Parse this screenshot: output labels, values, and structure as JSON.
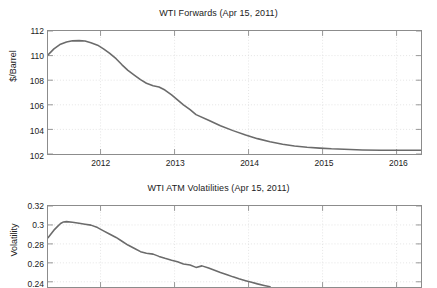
{
  "figure": {
    "width": 437,
    "height": 288,
    "background": "#ffffff",
    "line_color": "#6b6b6b",
    "axis_color": "#8c8c8c",
    "grid_color": "#d9d9d9",
    "note": "MATLAB-style two-panel figure; lower panel is cropped at the image bottom edge"
  },
  "chart_data": [
    {
      "type": "line",
      "panel": "upper",
      "title": "WTI Forwards (Apr 15, 2011)",
      "xlabel": "",
      "ylabel": "$/Barrel",
      "xlim": [
        2011.29,
        2016.33
      ],
      "ylim": [
        102,
        112
      ],
      "xticks": [
        2012,
        2013,
        2014,
        2015,
        2016
      ],
      "xticklabels": [
        "2012",
        "2013",
        "2014",
        "2015",
        "2016"
      ],
      "yticks": [
        102,
        104,
        106,
        108,
        110,
        112
      ],
      "yticklabels": [
        "102",
        "104",
        "106",
        "108",
        "110",
        "112"
      ],
      "grid": true,
      "legend": null,
      "series": [
        {
          "name": "WTI forward curve",
          "color": "#6b6b6b",
          "x": [
            2011.29,
            2011.37,
            2011.45,
            2011.54,
            2011.62,
            2011.71,
            2011.79,
            2011.87,
            2011.96,
            2012.04,
            2012.12,
            2012.21,
            2012.29,
            2012.37,
            2012.46,
            2012.54,
            2012.62,
            2012.71,
            2012.79,
            2012.87,
            2012.96,
            2013.04,
            2013.12,
            2013.21,
            2013.29,
            2013.46,
            2013.62,
            2013.79,
            2013.96,
            2014.12,
            2014.29,
            2014.46,
            2014.62,
            2014.79,
            2014.96,
            2015.12,
            2015.29,
            2015.54,
            2015.79,
            2016.04,
            2016.33
          ],
          "y": [
            110.05,
            110.55,
            110.9,
            111.1,
            111.2,
            111.22,
            111.18,
            111.05,
            110.85,
            110.55,
            110.2,
            109.75,
            109.25,
            108.8,
            108.4,
            108.05,
            107.75,
            107.55,
            107.45,
            107.2,
            106.8,
            106.4,
            106.0,
            105.6,
            105.2,
            104.75,
            104.3,
            103.9,
            103.55,
            103.25,
            103.0,
            102.8,
            102.65,
            102.55,
            102.48,
            102.42,
            102.38,
            102.33,
            102.31,
            102.3,
            102.3
          ]
        }
      ]
    },
    {
      "type": "line",
      "panel": "lower",
      "title": "WTI ATM Volatilities (Apr 15, 2011)",
      "xlabel": "",
      "ylabel": "Volatility",
      "xlim": [
        2011.29,
        2016.33
      ],
      "ylim": [
        0.2345,
        0.32
      ],
      "xticks": [
        2012,
        2013,
        2014,
        2015,
        2016
      ],
      "xticklabels": [
        "2012",
        "2013",
        "2014",
        "2015",
        "2016"
      ],
      "yticks": [
        0.24,
        0.26,
        0.28,
        0.3,
        0.32
      ],
      "yticklabels": [
        "0.24",
        "0.26",
        "0.28",
        "0.3",
        "0.32"
      ],
      "grid": true,
      "legend": null,
      "cropped_at_bottom": true,
      "series": [
        {
          "name": "WTI ATM volatility curve",
          "color": "#6b6b6b",
          "x": [
            2011.29,
            2011.33,
            2011.37,
            2011.42,
            2011.46,
            2011.5,
            2011.54,
            2011.62,
            2011.71,
            2011.79,
            2011.87,
            2011.96,
            2012.04,
            2012.12,
            2012.21,
            2012.29,
            2012.37,
            2012.46,
            2012.54,
            2012.62,
            2012.71,
            2012.79,
            2012.87,
            2012.96,
            2013.04,
            2013.12,
            2013.21,
            2013.29,
            2013.37,
            2013.46,
            2013.54,
            2013.62,
            2013.71,
            2013.79,
            2013.87,
            2013.96,
            2014.04,
            2014.12,
            2014.21,
            2014.29
          ],
          "y": [
            0.2865,
            0.2905,
            0.2945,
            0.2985,
            0.3015,
            0.3032,
            0.3035,
            0.3028,
            0.3018,
            0.3008,
            0.2998,
            0.2972,
            0.2938,
            0.2905,
            0.2868,
            0.2828,
            0.2788,
            0.2752,
            0.2718,
            0.2702,
            0.2692,
            0.2668,
            0.2648,
            0.2628,
            0.2612,
            0.2588,
            0.2578,
            0.2552,
            0.2568,
            0.2545,
            0.2522,
            0.2498,
            0.2475,
            0.2452,
            0.2432,
            0.2412,
            0.2395,
            0.2378,
            0.2362,
            0.2348
          ]
        }
      ]
    }
  ]
}
